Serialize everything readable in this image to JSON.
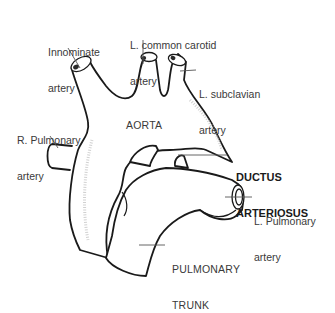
{
  "diagram": {
    "labels": {
      "innominate": {
        "line1": "Innominate",
        "line2": "artery"
      },
      "l_common_carotid": {
        "line1": "L. common carotid",
        "line2": "artery"
      },
      "l_subclavian": {
        "line1": "L. subclavian",
        "line2": "artery"
      },
      "r_pulmonary": {
        "line1": "R. Pulmonary",
        "line2": "artery"
      },
      "aorta": "AORTA",
      "ductus": {
        "line1": "DUCTUS",
        "line2": "ARTERIOSUS"
      },
      "l_pulmonary": {
        "line1": "L. Pulmonary",
        "line2": "artery"
      },
      "pulmonary_trunk": {
        "line1": "PULMONARY",
        "line2": "TRUNK"
      }
    },
    "colors": {
      "outline": "#1a1a1a",
      "text": "#3a3a3a",
      "background": "#ffffff"
    }
  }
}
